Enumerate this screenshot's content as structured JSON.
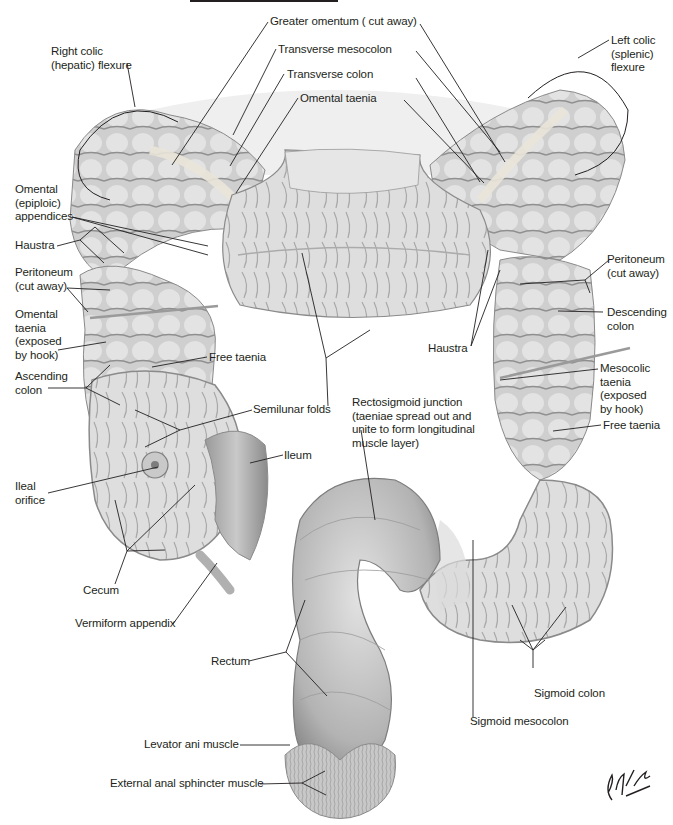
{
  "figure": {
    "artist_signature": "F. Netter M.D.",
    "colors": {
      "label_text": "#231f20",
      "leader_lines": "#231f20",
      "tissue_light": "#e4e4e4",
      "tissue_mid": "#b9b9b9",
      "tissue_dark": "#7a7a7a",
      "background": "#ffffff"
    }
  },
  "labels": {
    "greater_omentum": "Greater omentum ( cut away)",
    "transverse_mesocolon": "Transverse mesocolon",
    "transverse_colon": "Transverse colon",
    "omental_taenia_top": "Omental taenia",
    "right_colic_flexure": "Right colic\n(hepatic) flexure",
    "left_colic_flexure": "Left colic\n(splenic)\nflexure",
    "omental_appendices": "Omental\n(epiploic)\nappendices",
    "haustra_left": "Haustra",
    "peritoneum_left": "Peritoneum\n(cut away)",
    "omental_taenia_hook": "Omental\ntaenia\n(exposed\nby hook)",
    "free_taenia_left": "Free taenia",
    "ascending_colon": "Ascending\ncolon",
    "semilunar_folds": "Semilunar folds",
    "ileal_orifice": "Ileal\norifice",
    "ileum": "Ileum",
    "cecum": "Cecum",
    "vermiform_appendix": "Vermiform appendix",
    "haustra_right": "Haustra",
    "peritoneum_right": "Peritoneum\n(cut away)",
    "descending_colon": "Descending\ncolon",
    "mesocolic_taenia": "Mesocolic\ntaenia\n(exposed\nby hook)",
    "free_taenia_right": "Free taenia",
    "rectosigmoid_junction": "Rectosigmoid junction\n(taeniae spread out and\nunite to form longitudinal\nmuscle layer)",
    "rectum": "Rectum",
    "sigmoid_colon": "Sigmoid colon",
    "sigmoid_mesocolon": "Sigmoid mesocolon",
    "levator_ani": "Levator ani muscle",
    "external_anal_sphincter": "External anal sphincter muscle"
  }
}
